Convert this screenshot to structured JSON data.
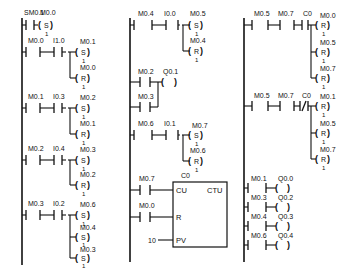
{
  "diagram": {
    "type": "ladder-logic",
    "columns": [
      {
        "id": "col1",
        "rungs": [
          {
            "contacts": [
              {
                "addr": "SM0.1",
                "type": "NO"
              }
            ],
            "coils": [
              {
                "addr": "M0.0",
                "op": "S",
                "count": "1"
              }
            ]
          },
          {
            "contacts": [
              {
                "addr": "M0.0",
                "type": "NO"
              },
              {
                "addr": "I1.0",
                "type": "NO"
              }
            ],
            "coils": [
              {
                "addr": "M0.1",
                "op": "S",
                "count": "1"
              },
              {
                "addr": "M0.0",
                "op": "R",
                "count": "1"
              }
            ]
          },
          {
            "contacts": [
              {
                "addr": "M0.1",
                "type": "NO"
              },
              {
                "addr": "I0.3",
                "type": "NO"
              }
            ],
            "coils": [
              {
                "addr": "M0.2",
                "op": "S",
                "count": "1"
              },
              {
                "addr": "M0.1",
                "op": "R",
                "count": "1"
              }
            ]
          },
          {
            "contacts": [
              {
                "addr": "M0.2",
                "type": "NO"
              },
              {
                "addr": "I0.4",
                "type": "NO"
              }
            ],
            "coils": [
              {
                "addr": "M0.3",
                "op": "S",
                "count": "1"
              },
              {
                "addr": "M0.2",
                "op": "R",
                "count": "1"
              }
            ]
          },
          {
            "contacts": [
              {
                "addr": "M0.3",
                "type": "NO"
              },
              {
                "addr": "I0.2",
                "type": "NO"
              }
            ],
            "coils": [
              {
                "addr": "M0.6",
                "op": "S",
                "count": "1"
              },
              {
                "addr": "M0.4",
                "op": "S",
                "count": "1"
              },
              {
                "addr": "M0.3",
                "op": "S",
                "count": "1"
              }
            ]
          }
        ]
      },
      {
        "id": "col2",
        "rungs": [
          {
            "contacts": [
              {
                "addr": "M0.4",
                "type": "NO"
              },
              {
                "addr": "I0.0",
                "type": "NO"
              }
            ],
            "coils": [
              {
                "addr": "M0.5",
                "op": "S",
                "count": "1"
              },
              {
                "addr": "M0.4",
                "op": "R",
                "count": "1"
              }
            ]
          },
          {
            "contacts": [
              {
                "addr": "M0.2",
                "type": "NO"
              }
            ],
            "parallel": [
              {
                "addr": "M0.3",
                "type": "NO"
              }
            ],
            "coils": [
              {
                "addr": "Q0.1",
                "op": "",
                "count": ""
              }
            ]
          },
          {
            "contacts": [
              {
                "addr": "M0.6",
                "type": "NO"
              },
              {
                "addr": "I0.1",
                "type": "NO"
              }
            ],
            "coils": [
              {
                "addr": "M0.7",
                "op": "S",
                "count": "1"
              },
              {
                "addr": "M0.6",
                "op": "R",
                "count": "1"
              }
            ]
          },
          {
            "counter": {
              "name": "C0",
              "type": "CTU",
              "cu_label": "CU",
              "r_label": "R",
              "pv_label": "PV",
              "cu_contact": "M0.7",
              "r_contact": "M0.0",
              "pv_value": "10"
            }
          }
        ]
      },
      {
        "id": "col3",
        "rungs": [
          {
            "contacts": [
              {
                "addr": "M0.5",
                "type": "NO"
              },
              {
                "addr": "M0.7",
                "type": "NO"
              },
              {
                "addr": "C0",
                "type": "NO"
              }
            ],
            "coils": [
              {
                "addr": "M0.0",
                "op": "R",
                "count": "1"
              },
              {
                "addr": "M0.5",
                "op": "R",
                "count": "1"
              },
              {
                "addr": "M0.7",
                "op": "R",
                "count": "1"
              }
            ]
          },
          {
            "contacts": [
              {
                "addr": "M0.5",
                "type": "NO"
              },
              {
                "addr": "M0.7",
                "type": "NO"
              },
              {
                "addr": "C0",
                "type": "NC"
              }
            ],
            "coils": [
              {
                "addr": "M0.1",
                "op": "R",
                "count": "1"
              },
              {
                "addr": "M0.5",
                "op": "R",
                "count": "1"
              },
              {
                "addr": "M0.7",
                "op": "R",
                "count": "1"
              }
            ]
          },
          {
            "contacts": [
              {
                "addr": "M0.1",
                "type": "NO"
              }
            ],
            "coils": [
              {
                "addr": "Q0.0",
                "op": "",
                "count": ""
              }
            ]
          },
          {
            "contacts": [
              {
                "addr": "M0.3",
                "type": "NO"
              }
            ],
            "coils": [
              {
                "addr": "Q0.2",
                "op": "",
                "count": ""
              }
            ]
          },
          {
            "contacts": [
              {
                "addr": "M0.4",
                "type": "NO"
              }
            ],
            "coils": [
              {
                "addr": "Q0.3",
                "op": "",
                "count": ""
              }
            ]
          },
          {
            "contacts": [
              {
                "addr": "M0.6",
                "type": "NO"
              }
            ],
            "coils": [
              {
                "addr": "Q0.4",
                "op": "",
                "count": ""
              }
            ]
          }
        ]
      }
    ]
  }
}
